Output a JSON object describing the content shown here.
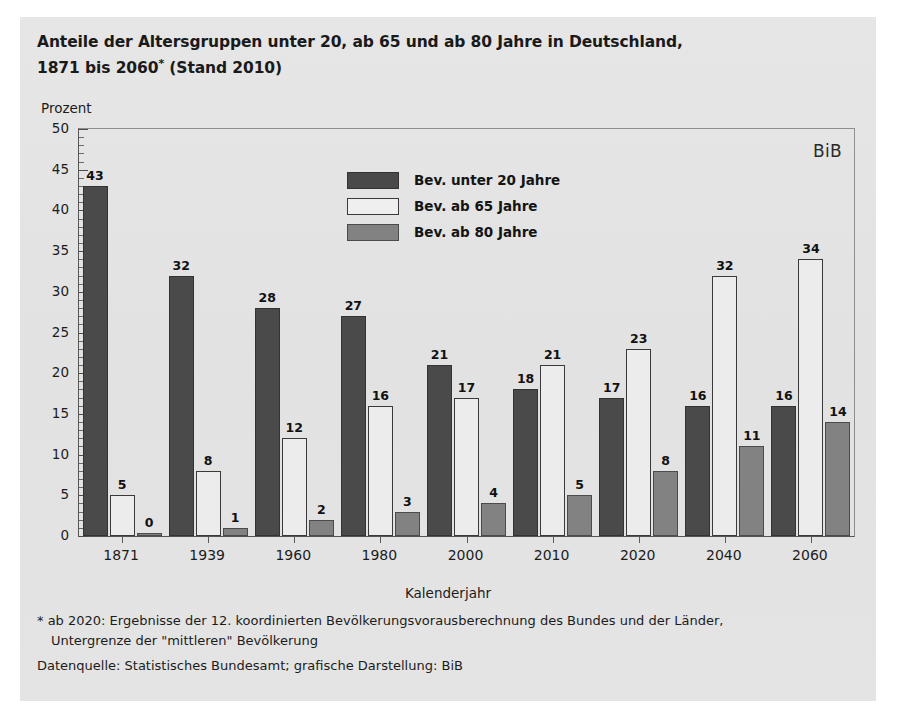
{
  "title": {
    "line1": "Anteile der Altersgruppen unter 20, ab 65 und ab 80 Jahre in Deutschland,",
    "line2_pre": "1871 bis 2060",
    "line2_sup": "*",
    "line2_post": " (Stand 2010)"
  },
  "badge": "BiB",
  "footnotes": {
    "note1": "* ab 2020: Ergebnisse der 12. koordinierten Bevölkerungsvorausberechnung des Bundes und der Länder,",
    "note2": "Untergrenze der \"mittleren\" Bevölkerung",
    "source": "Datenquelle: Statistisches Bundesamt; grafische Darstellung: BiB"
  },
  "colors": {
    "panel": "#e4e4e4",
    "series0": "#4a4a4a",
    "series1": "#ececec",
    "series2": "#828282",
    "axis": "#4d4d4d",
    "text": "#1c1c1c"
  },
  "chart_data": {
    "type": "bar",
    "title": "Anteile der Altersgruppen unter 20, ab 65 und ab 80 Jahre in Deutschland, 1871 bis 2060* (Stand 2010)",
    "xlabel": "Kalenderjahr",
    "ylabel": "Prozent",
    "ylim": [
      0,
      50
    ],
    "ytick_step": 5,
    "yticks": [
      0,
      5,
      10,
      15,
      20,
      25,
      30,
      35,
      40,
      45,
      50
    ],
    "yminor_step": 1,
    "grid": false,
    "legend_position": "top-center",
    "categories": [
      "1871",
      "1939",
      "1960",
      "1980",
      "2000",
      "2010",
      "2020",
      "2040",
      "2060"
    ],
    "series": [
      {
        "name": "Bev. unter 20 Jahre",
        "values": [
          43,
          32,
          28,
          27,
          21,
          18,
          17,
          16,
          16
        ]
      },
      {
        "name": "Bev. ab 65 Jahre",
        "values": [
          5,
          8,
          12,
          16,
          17,
          21,
          23,
          32,
          34
        ]
      },
      {
        "name": "Bev. ab 80 Jahre",
        "values": [
          0,
          1,
          2,
          3,
          4,
          5,
          8,
          11,
          14
        ]
      }
    ]
  }
}
